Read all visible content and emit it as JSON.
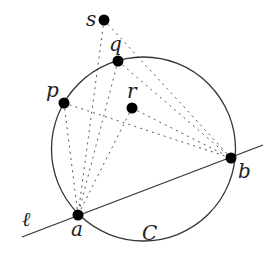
{
  "figure": {
    "width": 275,
    "height": 260,
    "circle": {
      "label": "C",
      "cx": 143.5,
      "cy": 149,
      "r": 92,
      "label_pos": [
        142,
        240
      ]
    },
    "line": {
      "label": "ℓ",
      "x1": 22,
      "y1": 237,
      "x2": 263,
      "y2": 145,
      "label_pos": [
        22,
        226
      ]
    },
    "points": [
      {
        "id": "s",
        "label": "s",
        "x": 104,
        "y": 20,
        "label_pos": [
          86,
          26
        ]
      },
      {
        "id": "q",
        "label": "q",
        "x": 118,
        "y": 61,
        "label_pos": [
          109,
          51
        ]
      },
      {
        "id": "p",
        "label": "p",
        "x": 64,
        "y": 103,
        "label_pos": [
          46,
          97
        ]
      },
      {
        "id": "r",
        "label": "r",
        "x": 132,
        "y": 108,
        "label_pos": [
          127,
          98
        ]
      },
      {
        "id": "b",
        "label": "b",
        "x": 231,
        "y": 158,
        "label_pos": [
          238,
          178
        ]
      },
      {
        "id": "a",
        "label": "a",
        "x": 78,
        "y": 215,
        "label_pos": [
          71,
          236
        ]
      }
    ],
    "dotted_segments": [
      {
        "from": "s",
        "to": "a"
      },
      {
        "from": "s",
        "to": "b"
      },
      {
        "from": "q",
        "to": "a"
      },
      {
        "from": "q",
        "to": "b"
      },
      {
        "from": "p",
        "to": "a"
      },
      {
        "from": "p",
        "to": "b"
      },
      {
        "from": "r",
        "to": "a"
      },
      {
        "from": "r",
        "to": "b"
      }
    ]
  }
}
